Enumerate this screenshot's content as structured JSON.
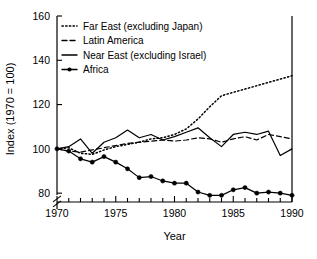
{
  "chart_data": {
    "type": "line",
    "title": "",
    "xlabel": "Year",
    "ylabel": "Index (1970 = 100)",
    "xlim": [
      1970,
      1990
    ],
    "ylim": [
      76,
      160
    ],
    "ytick_values": [
      80,
      100,
      120,
      140,
      160
    ],
    "ytick_labels": [
      "80",
      "100",
      "120",
      "140",
      "160"
    ],
    "xtick_values": [
      1970,
      1975,
      1980,
      1985,
      1990
    ],
    "xtick_labels": [
      "1970",
      "1975",
      "1980",
      "1985",
      "1990"
    ],
    "xminor_every": 1,
    "grid": false,
    "axis_break": true,
    "axis_break_note": "y-axis broken below 80",
    "legend_position": "top-left",
    "x": [
      1970,
      1971,
      1972,
      1973,
      1974,
      1975,
      1976,
      1977,
      1978,
      1979,
      1980,
      1981,
      1982,
      1983,
      1984,
      1985,
      1986,
      1987,
      1988,
      1989,
      1990
    ],
    "series": [
      {
        "name": "Far East (excluding Japan)",
        "style": "dotted",
        "marker": "none",
        "color": "#000000",
        "values": [
          100,
          100.5,
          98,
          97.5,
          99.5,
          101,
          102,
          103,
          104.5,
          105,
          106.5,
          109,
          113.5,
          119,
          124,
          125.5,
          127,
          128.5,
          130,
          131.5,
          133
        ]
      },
      {
        "name": "Latin America",
        "style": "dashed",
        "marker": "none",
        "color": "#000000",
        "values": [
          100,
          99,
          98.5,
          99.5,
          100.5,
          101.5,
          102.5,
          103,
          103.5,
          104,
          103.5,
          104,
          105,
          104.5,
          103,
          104.5,
          105.5,
          104,
          106.5,
          105.5,
          104.5
        ]
      },
      {
        "name": "Near East (excluding Israel)",
        "style": "solid",
        "marker": "none",
        "color": "#000000",
        "values": [
          100,
          101,
          104.5,
          98,
          103,
          105,
          108.5,
          105,
          106.5,
          104,
          105.5,
          107.5,
          109.5,
          105,
          101,
          106.5,
          107.5,
          106.5,
          108,
          97,
          100
        ]
      },
      {
        "name": "Africa",
        "style": "solid",
        "marker": "circle",
        "color": "#000000",
        "values": [
          100,
          99,
          95.5,
          94,
          96.5,
          94,
          91,
          87,
          87.5,
          85.5,
          84.5,
          84.5,
          80.5,
          79,
          79,
          81.5,
          82.5,
          80,
          80.5,
          80,
          79
        ]
      }
    ]
  }
}
